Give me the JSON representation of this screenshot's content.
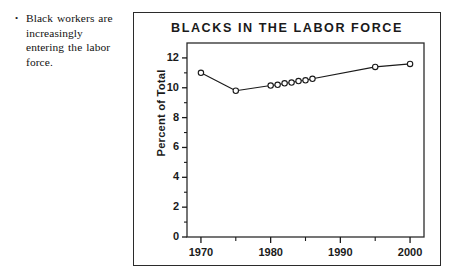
{
  "note": {
    "bullet_marker": "•",
    "text": "Black workers are increasingly entering the labor force."
  },
  "figure": {
    "title": "BLACKS IN THE LABOR FORCE"
  },
  "chart_data": {
    "type": "line",
    "title": "BLACKS IN THE LABOR FORCE",
    "xlabel": "",
    "ylabel": "Percent of Total",
    "xlim": [
      1968,
      2002
    ],
    "ylim": [
      0,
      13
    ],
    "grid": false,
    "legend": null,
    "marker": "open-circle",
    "x_major_ticks": [
      1970,
      1980,
      1990,
      2000
    ],
    "x_major_tick_labels": [
      "1970",
      "1980",
      "1990",
      "2000"
    ],
    "x_minor_ticks": [
      1975,
      1985,
      1995
    ],
    "y_ticks": [
      0,
      2,
      4,
      6,
      8,
      10,
      12
    ],
    "y_tick_labels": [
      "0",
      "2",
      "4",
      "6",
      "8",
      "10",
      "12"
    ],
    "y_minor_ticks": [
      1,
      3,
      5,
      7,
      9,
      11
    ],
    "series": [
      {
        "name": "Blacks in the labor force",
        "x": [
          1970,
          1975,
          1980,
          1981,
          1982,
          1983,
          1984,
          1985,
          1986,
          1995,
          2000
        ],
        "values": [
          11.0,
          9.8,
          10.15,
          10.2,
          10.3,
          10.35,
          10.45,
          10.5,
          10.6,
          11.4,
          11.6
        ]
      }
    ]
  },
  "colors": {
    "ink": "#1a1a1a",
    "frame": "#2b2b2b",
    "line": "#1a1a1a",
    "marker_fill": "#ffffff",
    "background": "#ffffff"
  }
}
